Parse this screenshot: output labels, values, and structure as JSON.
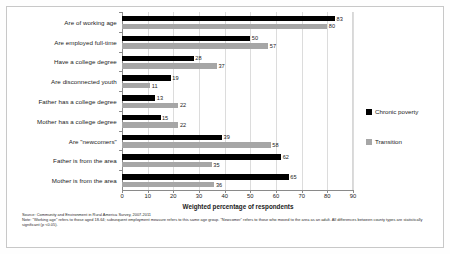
{
  "chart_data": {
    "type": "bar",
    "orientation": "horizontal",
    "title": "",
    "xlabel": "Weighted percentage of respondents",
    "ylabel": "",
    "xlim": [
      0,
      90
    ],
    "xticks": [
      0,
      10,
      20,
      30,
      40,
      50,
      60,
      70,
      80,
      90
    ],
    "grid": true,
    "legend_position": "right",
    "categories": [
      "Are of working age",
      "Are employed full-time",
      "Have a college degree",
      "Are disconnected youth",
      "Father has a college degree",
      "Mother has a college degree",
      "Are \"newcomers\"",
      "Father is from the area",
      "Mother is from the area"
    ],
    "series": [
      {
        "name": "Chronic poverty",
        "color": "#000000",
        "values": [
          83,
          50,
          28,
          19,
          13,
          15,
          39,
          62,
          65
        ]
      },
      {
        "name": "Transition",
        "color": "#A6A6A6",
        "values": [
          80,
          57,
          37,
          11,
          22,
          22,
          58,
          35,
          36
        ]
      }
    ]
  },
  "legend": {
    "items": [
      {
        "label": "Chronic poverty",
        "color": "#000000"
      },
      {
        "label": "Transition",
        "color": "#A6A6A6"
      }
    ]
  },
  "notes": {
    "source": "Source: Community and Environment in Rural America Survey, 2007-2011",
    "note": "Note: \"Working age\" refers to those aged 18-64; subsequent employment measure refers to this same age group. \"Newcomer\" refers to those who moved to the area as an adult. All differences between county types are statistically significant (p <0.05)."
  }
}
